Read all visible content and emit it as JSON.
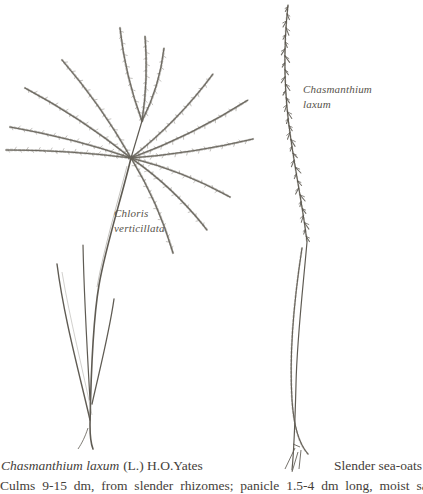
{
  "page": {
    "background": "#ffffff",
    "ink_color": "#57534b",
    "text_color": "#44403a"
  },
  "figures": {
    "chloris": {
      "name": "Chloris verticillata",
      "label_line1": "Chloris",
      "label_line2": "verticillata"
    },
    "chasmanthium": {
      "name": "Chasmanthium laxum",
      "label_line1": "Chasmanthium",
      "label_line2": "laxum"
    }
  },
  "caption": {
    "species_italic": "Chasmanthium laxum",
    "authority": "(L.) H.O.Yates",
    "common_name": "Slender sea-oats",
    "description_partial": "Culms 9-15 dm, from slender rhizomes; panicle 1.5-4 dm long, moist sandy"
  }
}
